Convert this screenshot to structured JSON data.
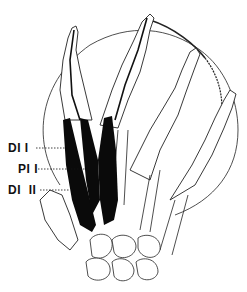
{
  "figure": {
    "labels": [
      {
        "text": "DI I",
        "x": 8,
        "y": 142
      },
      {
        "text": "PI I",
        "x": 18,
        "y": 163
      },
      {
        "text": "DI  II",
        "x": 8,
        "y": 184
      }
    ],
    "colors": {
      "ink": "#111111",
      "background": "#ffffff",
      "muscle": "#0a0a0a"
    }
  }
}
